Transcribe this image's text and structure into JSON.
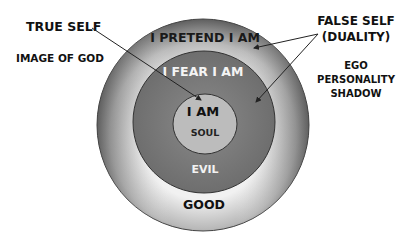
{
  "diagram": {
    "rings": {
      "outer": {
        "label": "I PRETEND I AM",
        "bottom_label": "GOOD"
      },
      "middle": {
        "label": "I FEAR I AM",
        "bottom_label": "EVIL"
      },
      "inner": {
        "label": "I AM",
        "sub_label": "SOUL"
      }
    },
    "left_annotations": {
      "true_self": "TRUE SELF",
      "image_of_god": "IMAGE OF GOD"
    },
    "right_annotations": {
      "false_self_line1": "FALSE SELF",
      "false_self_line2": "(DUALITY)",
      "ego": "EGO",
      "personality": "PERSONALITY",
      "shadow": "SHADOW"
    },
    "colors": {
      "outer_light": "#efefef",
      "outer_dark": "#6a6a6a",
      "middle": "#7c7c7c",
      "inner": "#bdbdbd",
      "text_dark": "#111111",
      "text_light": "#f2f2f2"
    }
  }
}
